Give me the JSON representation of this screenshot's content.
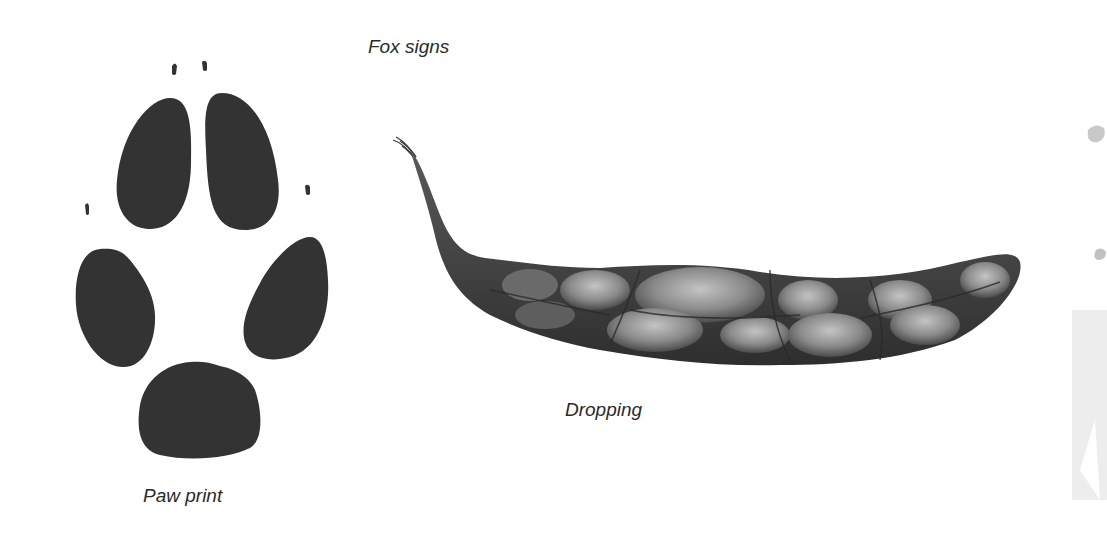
{
  "title": "Fox signs",
  "figures": {
    "paw_print": {
      "label": "Paw print",
      "pads": 5,
      "claw_marks": 4
    },
    "dropping": {
      "label": "Dropping"
    }
  },
  "colors": {
    "pad": "#333333",
    "background": "#ffffff",
    "text": "#2a2a2a"
  }
}
